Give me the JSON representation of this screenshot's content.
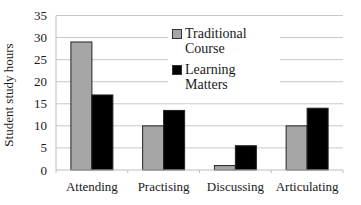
{
  "chart_data": {
    "type": "bar",
    "title": "",
    "xlabel": "",
    "ylabel": "Student study hours",
    "ylim": [
      0,
      35
    ],
    "yticks": [
      0,
      5,
      10,
      15,
      20,
      25,
      30,
      35
    ],
    "grid": true,
    "legend_position": "upper center (inside plot)",
    "categories": [
      "Attending",
      "Practising",
      "Discussing",
      "Articulating"
    ],
    "series": [
      {
        "name": "Traditional Course",
        "color": "#a6a6a6",
        "values": [
          29,
          10,
          1,
          10
        ]
      },
      {
        "name": "Learning Matters",
        "color": "#000000",
        "values": [
          17,
          13.5,
          5.5,
          14
        ]
      }
    ]
  },
  "legend": {
    "items": [
      {
        "label_line1": "Traditional",
        "label_line2": "Course"
      },
      {
        "label_line1": "Learning Matters"
      }
    ]
  },
  "axis": {
    "y_label": "Student study hours",
    "y_tick_labels": [
      "0",
      "5",
      "10",
      "15",
      "20",
      "25",
      "30",
      "35"
    ],
    "x_tick_labels": [
      "Attending",
      "Practising",
      "Discussing",
      "Articulating"
    ]
  }
}
